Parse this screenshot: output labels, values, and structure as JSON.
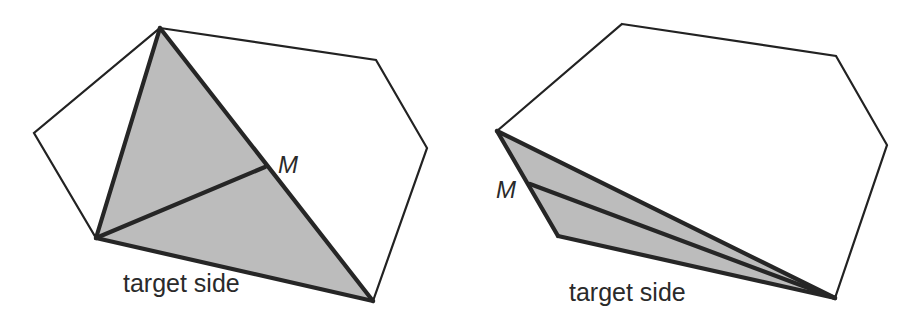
{
  "figure": {
    "panels": [
      {
        "id": "left",
        "polygon": [
          [
            160,
            28
          ],
          [
            376,
            60
          ],
          [
            427,
            148
          ],
          [
            373,
            301
          ],
          [
            96,
            238
          ],
          [
            34,
            133
          ]
        ],
        "shaded_triangle": [
          [
            160,
            28
          ],
          [
            373,
            301
          ],
          [
            96,
            238
          ]
        ],
        "median_from": [
          96,
          238
        ],
        "midpoint": [
          265,
          167
        ],
        "midpoint_label": "M",
        "midpoint_label_pos": [
          278,
          173
        ],
        "side_label": "target side",
        "side_label_pos": [
          123,
          292
        ]
      },
      {
        "id": "right",
        "polygon": [
          [
            622,
            24
          ],
          [
            836,
            56
          ],
          [
            887,
            145
          ],
          [
            835,
            298
          ],
          [
            558,
            236
          ],
          [
            497,
            131
          ]
        ],
        "shaded_triangle": [
          [
            497,
            131
          ],
          [
            835,
            298
          ],
          [
            558,
            236
          ]
        ],
        "median_from": [
          835,
          298
        ],
        "midpoint": [
          530,
          184
        ],
        "midpoint_label": "M",
        "midpoint_label_pos": [
          496,
          198
        ],
        "side_label": "target side",
        "side_label_pos": [
          569,
          301
        ]
      }
    ],
    "colors": {
      "fill": "#bcbcbc",
      "stroke": "#262626",
      "outline": "#222222"
    }
  }
}
